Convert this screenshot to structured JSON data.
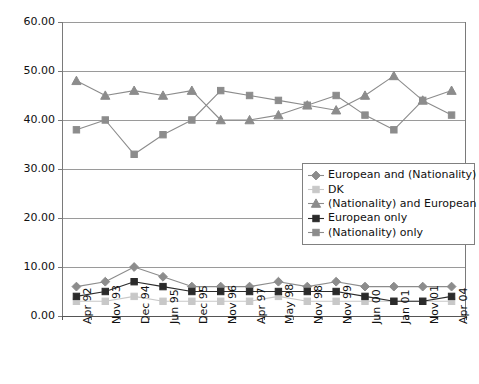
{
  "chart_data": {
    "type": "line",
    "title": "",
    "subtitle": "",
    "xlabel": "",
    "ylabel": "",
    "ylim": [
      0,
      60
    ],
    "ytick_step": 10,
    "ytick_labels": [
      "0.00",
      "10.00",
      "20.00",
      "30.00",
      "40.00",
      "50.00",
      "60.00"
    ],
    "ytick_values": [
      0,
      10,
      20,
      30,
      40,
      50,
      60
    ],
    "grid": true,
    "grid_axis": "y",
    "legend_position": "center-right-inside",
    "categories": [
      "Apr 92",
      "Nov 93",
      "Dec 94",
      "Jun 95",
      "Dec 95",
      "Nov 96",
      "Apr 97",
      "May 98",
      "Nov 98",
      "Nov 99",
      "Jun 00",
      "Jan 01",
      "Nov 01",
      "Apr 04"
    ],
    "series": [
      {
        "name": "European and (Nationality)",
        "marker": "diamond",
        "color": "#8c8c8c",
        "line_color": "#8c8c8c",
        "values": [
          6,
          7,
          10,
          8,
          6,
          6,
          6,
          7,
          6,
          7,
          6,
          6,
          6,
          6
        ]
      },
      {
        "name": "DK",
        "marker": "square",
        "color": "#c8c8c8",
        "line_color": "#c8c8c8",
        "values": [
          3,
          3,
          4,
          3,
          3,
          3,
          3,
          4,
          3,
          3,
          3,
          3,
          3,
          3
        ]
      },
      {
        "name": "(Nationality) and European",
        "marker": "triangle",
        "color": "#8c8c8c",
        "line_color": "#8c8c8c",
        "values": [
          48,
          45,
          46,
          45,
          46,
          40,
          40,
          41,
          43,
          42,
          45,
          49,
          44,
          46
        ]
      },
      {
        "name": "European only",
        "marker": "square",
        "color": "#2b2b2b",
        "line_color": "#2b2b2b",
        "values": [
          4,
          5,
          7,
          6,
          5,
          5,
          5,
          5,
          5,
          5,
          4,
          3,
          3,
          4
        ]
      },
      {
        "name": "(Nationality) only",
        "marker": "square",
        "color": "#8c8c8c",
        "line_color": "#8c8c8c",
        "values": [
          38,
          40,
          33,
          37,
          40,
          46,
          45,
          44,
          43,
          45,
          41,
          38,
          44,
          41
        ]
      }
    ]
  },
  "legend": {
    "items": [
      {
        "label": "European and (Nationality)",
        "marker": "diamond",
        "color": "#8c8c8c"
      },
      {
        "label": "DK",
        "marker": "square",
        "color": "#c8c8c8"
      },
      {
        "label": "(Nationality) and European",
        "marker": "triangle",
        "color": "#8c8c8c"
      },
      {
        "label": "European only",
        "marker": "square",
        "color": "#2b2b2b"
      },
      {
        "label": "(Nationality) only",
        "marker": "square",
        "color": "#8c8c8c"
      }
    ]
  },
  "style": {
    "axis_color": "#7a7a7a",
    "grid_color": "#9a9a9a",
    "plot_background": "#ffffff",
    "text_color": "#111111"
  }
}
